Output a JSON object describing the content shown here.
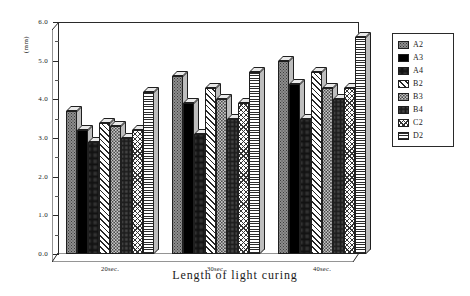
{
  "chart_data": {
    "type": "bar",
    "title": "",
    "xlabel": "Length of light curing",
    "ylabel": "(mm)",
    "categories": [
      "20sec.",
      "30sec.",
      "40sec."
    ],
    "ylim": [
      0.0,
      6.0
    ],
    "ytick_labels": [
      "0.0",
      "1.0",
      "2.0",
      "3.0",
      "4.0",
      "5.0",
      "6.0"
    ],
    "ytick_values": [
      0.0,
      1.0,
      2.0,
      3.0,
      4.0,
      5.0,
      6.0
    ],
    "grid": false,
    "legend_position": "right-outside",
    "series": [
      {
        "name": "A2",
        "pattern": "dark-speckle",
        "values": [
          3.7,
          4.6,
          5.0
        ]
      },
      {
        "name": "A3",
        "pattern": "solid-black",
        "values": [
          3.2,
          3.9,
          4.4
        ]
      },
      {
        "name": "A4",
        "pattern": "dense-dots",
        "values": [
          2.9,
          3.1,
          3.5
        ]
      },
      {
        "name": "B2",
        "pattern": "diagonal-hatch",
        "values": [
          3.4,
          4.3,
          4.7
        ]
      },
      {
        "name": "B3",
        "pattern": "light-speckle",
        "values": [
          3.3,
          4.0,
          4.3
        ]
      },
      {
        "name": "B4",
        "pattern": "mid-dots",
        "values": [
          3.0,
          3.5,
          4.0
        ]
      },
      {
        "name": "C2",
        "pattern": "cross-hatch",
        "values": [
          3.2,
          3.9,
          4.3
        ]
      },
      {
        "name": "D2",
        "pattern": "horizontal-lines",
        "values": [
          4.2,
          4.7,
          5.6
        ]
      }
    ]
  },
  "legend": {
    "items": [
      {
        "label": "A2"
      },
      {
        "label": "A3"
      },
      {
        "label": "A4"
      },
      {
        "label": "B2"
      },
      {
        "label": "B3"
      },
      {
        "label": "B4"
      },
      {
        "label": "C2"
      },
      {
        "label": "D2"
      }
    ]
  }
}
